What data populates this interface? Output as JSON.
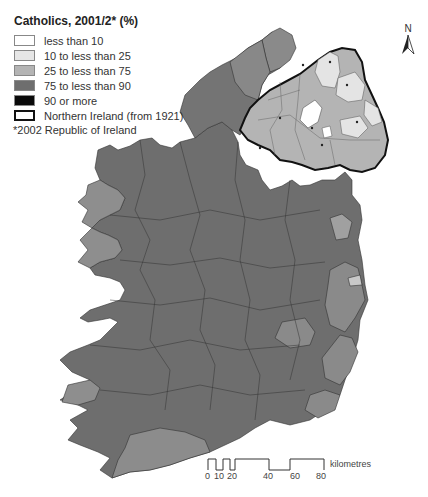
{
  "legend": {
    "title": "Catholics, 2001/2* (%)",
    "items": [
      {
        "label": "less than 10",
        "color": "#ffffff"
      },
      {
        "label": "10 to less than 25",
        "color": "#e6e6e6"
      },
      {
        "label": "25 to less than 75",
        "color": "#b4b4b4"
      },
      {
        "label": "75 to less than 90",
        "color": "#6e6e6e"
      },
      {
        "label": "90 or more",
        "color": "#0a0a0a"
      },
      {
        "label": "Northern Ireland (from 1921)",
        "color": "#ffffff"
      }
    ]
  },
  "note": "*2002 Republic of Ireland",
  "north_arrow": {
    "label": "N"
  },
  "scale_bar": {
    "unit": "kilometres",
    "ticks": [
      "0",
      "10",
      "20",
      "40",
      "60",
      "80"
    ]
  },
  "colors": {
    "class_75_90": "#6e6e6e",
    "class_25_75": "#a9a9a9",
    "class_10_25": "#e4e4e4",
    "class_lt10": "#ffffff",
    "boundary": "#333333",
    "ni_border": "#111111"
  }
}
